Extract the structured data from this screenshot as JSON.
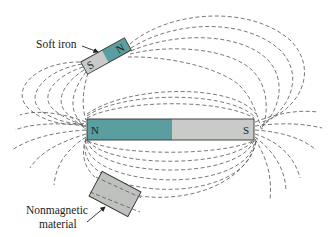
{
  "figure": {
    "type": "magnetic field diagram",
    "colors": {
      "north_pole": "#5a9ea0",
      "south_pole": "#c9cbc8",
      "nonmagnetic": "#bfc1be",
      "field_line": "#555555",
      "background": "#ffffff"
    }
  },
  "bar_magnet": {
    "north_label": "N",
    "south_label": "S"
  },
  "soft_iron": {
    "label": "Soft iron",
    "north_label": "N",
    "south_label": "S"
  },
  "nonmagnetic": {
    "label_line1": "Nonmagnetic",
    "label_line2": "material"
  }
}
